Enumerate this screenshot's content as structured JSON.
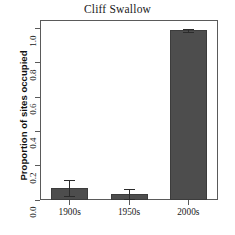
{
  "chart_data": {
    "type": "bar",
    "title": "Cliff Swallow",
    "xlabel": "",
    "ylabel": "Proportion of sites occupied",
    "categories": [
      "1900s",
      "1950s",
      "2000s"
    ],
    "values": [
      0.07,
      0.035,
      0.99
    ],
    "errors_upper": [
      0.045,
      0.032,
      0.008
    ],
    "errors_lower": [
      0.045,
      0.032,
      0.008
    ],
    "ylim": [
      0.0,
      1.05
    ],
    "yticks": [
      0.0,
      0.2,
      0.4,
      0.6,
      0.8,
      1.0
    ],
    "ytick_labels": [
      "0.0",
      "0.2",
      "0.4",
      "0.6",
      "0.8",
      "1.0"
    ],
    "grid": false,
    "legend": "none",
    "bar_color": "#4d4d4d",
    "bar_edge_color": "#3c3c3c",
    "error_bar_color": "#2b2b2b",
    "axis_color": "#5a5a5a",
    "background_color": "#ffffff"
  }
}
